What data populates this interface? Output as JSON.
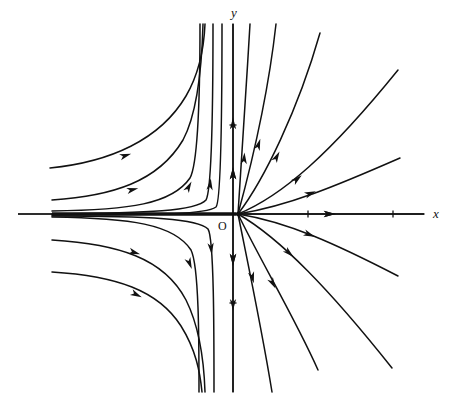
{
  "figure": {
    "background_color": "#ffffff",
    "stroke_color": "#111111",
    "width": 455,
    "height": 415
  },
  "axes": {
    "x_label": "x",
    "y_label": "y",
    "origin_label": "O",
    "origin_px": {
      "x": 238,
      "y": 214
    },
    "x_axis": {
      "x1": 18,
      "y1": 214,
      "x2": 424,
      "y2": 214
    },
    "y_axis": {
      "x1": 233,
      "y1": 24,
      "x2": 233,
      "y2": 392
    },
    "x_label_px": {
      "x": 433,
      "y": 218
    },
    "y_label_px": {
      "x": 231,
      "y": 17
    },
    "origin_label_px": {
      "x": 218,
      "y": 230
    },
    "x_ticks_px": [
      308,
      393
    ],
    "y_ticks_px": [
      125,
      303
    ]
  },
  "chart_data": {
    "type": "line",
    "xlabel": "x",
    "ylabel": "y",
    "grid": false,
    "legend": null,
    "annotations": [
      {
        "text": "O",
        "x": 218,
        "y": 230,
        "note": "origin label"
      },
      {
        "text": "x",
        "x": 433,
        "y": 218,
        "note": "horizontal axis label"
      },
      {
        "text": "y",
        "x": 231,
        "y": 17,
        "note": "vertical axis label"
      }
    ],
    "axis_arrow_markers": [
      {
        "axis": "x",
        "at_px": 328,
        "direction": "right"
      },
      {
        "axis": "y",
        "at_px": 175,
        "direction": "up"
      },
      {
        "axis": "y",
        "at_px": 258,
        "direction": "down"
      }
    ],
    "trajectories": [
      {
        "name": "ul-outer",
        "quadrant": "upper-left",
        "path": "M 50,168 C 110,162 160,140 186,96 C 200,72 204,48 205,24",
        "arrows": [
          {
            "x": 124,
            "y": 156,
            "angle": -18
          }
        ]
      },
      {
        "name": "ul-mid",
        "quadrant": "upper-left",
        "path": "M 52,200 C 112,196 158,182 183,140 C 198,112 202,62 203,24",
        "arrows": [
          {
            "x": 131,
            "y": 190,
            "angle": -14
          }
        ]
      },
      {
        "name": "ul-inner",
        "quadrant": "upper-left",
        "path": "M 52,211 C 130,210 172,204 190,178 C 199,162 200,80 200,24",
        "arrows": [
          {
            "x": 188,
            "y": 188,
            "angle": -62
          }
        ]
      },
      {
        "name": "ul-near-axis",
        "quadrant": "upper-left",
        "path": "M 52,214 C 150,213 196,211 206,200 C 212,190 213,90 213,24",
        "arrows": [
          {
            "x": 210,
            "y": 186,
            "angle": -84
          }
        ]
      },
      {
        "name": "ul-vertical-a",
        "quadrant": "upper-left",
        "path": "M 52,215 C 170,215 206,214 216,207 C 221,202 222,100 222,24",
        "arrows": []
      },
      {
        "name": "ll-outer",
        "quadrant": "lower-left",
        "path": "M 52,240 C 118,244 164,258 186,300 C 200,328 204,362 205,392",
        "arrows": [
          {
            "x": 133,
            "y": 252,
            "angle": 18
          }
        ]
      },
      {
        "name": "ll-mid",
        "quadrant": "lower-left",
        "path": "M 52,272 C 116,276 158,290 181,326 C 196,350 200,372 202,392",
        "arrows": [
          {
            "x": 135,
            "y": 294,
            "angle": 26
          }
        ]
      },
      {
        "name": "ll-inner",
        "quadrant": "lower-left",
        "path": "M 52,217 C 130,218 174,224 191,250 C 199,266 199,340 199,392",
        "arrows": [
          {
            "x": 189,
            "y": 262,
            "angle": 68
          }
        ]
      },
      {
        "name": "ll-near-axis",
        "quadrant": "lower-left",
        "path": "M 52,216 C 152,216 198,219 208,229 C 214,238 214,330 214,392",
        "arrows": [
          {
            "x": 211,
            "y": 247,
            "angle": 84
          }
        ]
      },
      {
        "name": "y-axis-up-flow",
        "quadrant": "upper-axis",
        "path": "M 233,214 L 233,24",
        "arrows": [
          {
            "x": 233,
            "y": 175,
            "angle": -90
          },
          {
            "x": 233,
            "y": 125,
            "angle": -90
          }
        ]
      },
      {
        "name": "y-axis-down-flow",
        "quadrant": "lower-axis",
        "path": "M 233,214 L 233,392",
        "arrows": [
          {
            "x": 233,
            "y": 258,
            "angle": 90
          },
          {
            "x": 233,
            "y": 303,
            "angle": 90
          }
        ]
      },
      {
        "name": "ur-steep",
        "quadrant": "upper-right",
        "path": "M 238,214 C 242,160 246,90 250,24",
        "arrows": [
          {
            "x": 244,
            "y": 160,
            "angle": -86
          }
        ]
      },
      {
        "name": "ur-steep2",
        "quadrant": "upper-right",
        "path": "M 238,214 C 250,170 268,96 276,24",
        "arrows": [
          {
            "x": 258,
            "y": 146,
            "angle": -72
          }
        ]
      },
      {
        "name": "ur-diag",
        "quadrant": "upper-right",
        "path": "M 238,214 C 264,180 298,110 320,33",
        "arrows": [
          {
            "x": 276,
            "y": 158,
            "angle": -62
          }
        ]
      },
      {
        "name": "ur-curve",
        "quadrant": "upper-right",
        "path": "M 238,214 C 282,196 330,154 398,70",
        "arrows": [
          {
            "x": 296,
            "y": 180,
            "angle": -40
          }
        ]
      },
      {
        "name": "ur-shallow",
        "quadrant": "upper-right",
        "path": "M 238,214 C 288,206 336,186 400,158",
        "arrows": [
          {
            "x": 309,
            "y": 194,
            "angle": -22
          }
        ]
      },
      {
        "name": "x-axis-out-flow",
        "quadrant": "right-axis",
        "path": "M 238,214 L 424,214",
        "arrows": [
          {
            "x": 328,
            "y": 214,
            "angle": 0
          }
        ]
      },
      {
        "name": "lr-shallow",
        "quadrant": "lower-right",
        "path": "M 238,214 C 288,222 336,244 398,276",
        "arrows": [
          {
            "x": 308,
            "y": 234,
            "angle": 22
          }
        ]
      },
      {
        "name": "lr-curve",
        "quadrant": "lower-right",
        "path": "M 238,214 C 280,238 330,290 392,368",
        "arrows": [
          {
            "x": 288,
            "y": 252,
            "angle": 42
          }
        ]
      },
      {
        "name": "lr-diag",
        "quadrant": "lower-right",
        "path": "M 238,214 C 258,256 296,320 318,370",
        "arrows": [
          {
            "x": 272,
            "y": 282,
            "angle": 62
          }
        ]
      },
      {
        "name": "lr-steep",
        "quadrant": "lower-right",
        "path": "M 238,214 C 248,264 262,330 272,392",
        "arrows": [
          {
            "x": 252,
            "y": 276,
            "angle": 76
          }
        ]
      }
    ],
    "stable_manifold_note": "Thick bundle of trajectories collapses onto the negative x-axis, flowing right toward the origin.",
    "unstable_manifold_note": "Trajectories fan out of the origin into the right half-plane and along +x."
  }
}
